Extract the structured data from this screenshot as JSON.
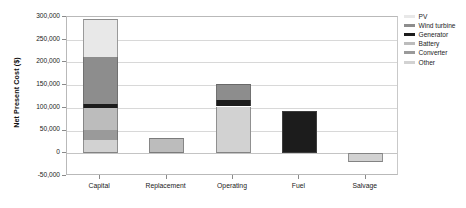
{
  "chart_data": {
    "type": "bar",
    "subtype": "stacked-bar",
    "title": "",
    "xlabel": "",
    "ylabel": "Net Present Cost ($)",
    "categories": [
      "Capital",
      "Replacement",
      "Operating",
      "Fuel",
      "Salvage"
    ],
    "ylim": [
      -50000,
      300000
    ],
    "ytick_values": [
      -50000,
      0,
      50000,
      100000,
      150000,
      200000,
      250000,
      300000
    ],
    "ytick_labels": [
      "-50,000",
      "0",
      "50,000",
      "100,000",
      "150,000",
      "200,000",
      "250,000",
      "300,000"
    ],
    "grid": true,
    "legend_position": "right",
    "series": [
      {
        "name": "PV",
        "color": "#e8e8e8",
        "values": [
          83000,
          0,
          0,
          0,
          0
        ]
      },
      {
        "name": "Wind turbine",
        "color": "#8d8d8d",
        "values": [
          104000,
          0,
          35000,
          0,
          0
        ]
      },
      {
        "name": "Generator",
        "color": "#1c1c1c",
        "values": [
          8000,
          0,
          14000,
          93000,
          0
        ]
      },
      {
        "name": "Battery",
        "color": "#bcbcbc",
        "values": [
          48000,
          33000,
          0,
          0,
          0
        ]
      },
      {
        "name": "Converter",
        "color": "#9a9a9a",
        "values": [
          22000,
          0,
          0,
          0,
          0
        ]
      },
      {
        "name": "Other",
        "color": "#d2d2d2",
        "values": [
          30000,
          0,
          103000,
          0,
          -20000
        ]
      }
    ],
    "stack_order_bottom_to_top": [
      "Other",
      "Converter",
      "Battery",
      "Generator",
      "Wind turbine",
      "PV"
    ],
    "totals": [
      295000,
      33000,
      152000,
      93000,
      -20000
    ]
  },
  "legend": {
    "items": [
      {
        "label": "PV"
      },
      {
        "label": "Wind turbine"
      },
      {
        "label": "Generator"
      },
      {
        "label": "Battery"
      },
      {
        "label": "Converter"
      },
      {
        "label": "Other"
      }
    ]
  },
  "colors": {
    "plot_border": "#b9b9b9",
    "gridline": "#d8d8d8",
    "background": "#ffffff",
    "text": "#1a1a1a"
  }
}
